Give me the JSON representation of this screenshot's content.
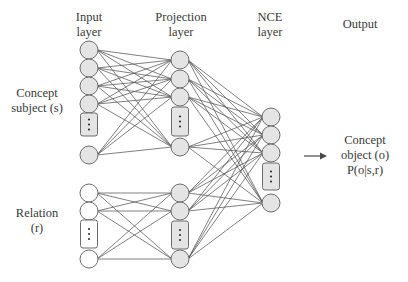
{
  "diagram": {
    "type": "neural-network-architecture",
    "colors": {
      "node_fill": "#e4e4e4",
      "input_relation_fill": "#ffffff",
      "node_stroke": "#6b6b6b",
      "edge": "#555555",
      "text": "#3a3a3a"
    },
    "layers": [
      {
        "id": "input",
        "title_line1": "Input",
        "title_line2": "layer"
      },
      {
        "id": "projection",
        "title_line1": "Projection",
        "title_line2": "layer"
      },
      {
        "id": "nce",
        "title_line1": "NCE",
        "title_line2": "layer"
      },
      {
        "id": "output",
        "title_line1": "Output"
      }
    ],
    "inputs": {
      "subject": {
        "line1": "Concept",
        "line2": "subject (s)"
      },
      "relation": {
        "line1": "Relation",
        "line2": "(r)"
      }
    },
    "output": {
      "line1": "Concept",
      "line2": "object (o)",
      "line3": "P(o|s,r)"
    },
    "ellipsis_glyph": "⋮",
    "arrow": "right-arrow"
  }
}
